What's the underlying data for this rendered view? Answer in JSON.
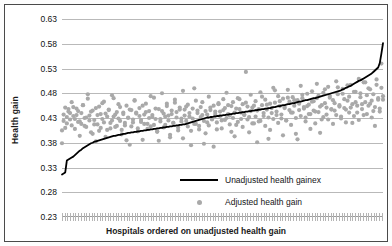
{
  "chart_data": {
    "type": "scatter",
    "title": "",
    "xlabel": "Hospitals ordered on unadjusted health gain",
    "ylabel": "Health gain",
    "ylim": [
      0.23,
      0.63
    ],
    "yticks": [
      "0.23",
      "0.28",
      "0.33",
      "0.38",
      "0.43",
      "0.48",
      "0.53",
      "0.58",
      "0.63"
    ],
    "ytick_values": [
      0.23,
      0.28,
      0.33,
      0.38,
      0.43,
      0.48,
      0.53,
      0.58,
      0.63
    ],
    "xticks": [],
    "grid": true,
    "legend_position": "inside-bottom-center",
    "n_points": 200,
    "series": [
      {
        "name": "Unadjusted health gainex",
        "type": "line",
        "color": "#000000",
        "values": [
          0.316,
          0.318,
          0.32,
          0.344,
          0.346,
          0.348,
          0.35,
          0.352,
          0.355,
          0.358,
          0.361,
          0.364,
          0.366,
          0.369,
          0.371,
          0.373,
          0.375,
          0.377,
          0.379,
          0.38,
          0.382,
          0.383,
          0.384,
          0.385,
          0.386,
          0.387,
          0.388,
          0.389,
          0.39,
          0.391,
          0.392,
          0.393,
          0.394,
          0.394,
          0.395,
          0.396,
          0.396,
          0.397,
          0.398,
          0.398,
          0.399,
          0.4,
          0.4,
          0.401,
          0.401,
          0.402,
          0.402,
          0.403,
          0.403,
          0.404,
          0.404,
          0.405,
          0.405,
          0.406,
          0.406,
          0.407,
          0.407,
          0.408,
          0.408,
          0.409,
          0.409,
          0.41,
          0.41,
          0.411,
          0.411,
          0.412,
          0.412,
          0.413,
          0.413,
          0.414,
          0.414,
          0.415,
          0.415,
          0.416,
          0.416,
          0.417,
          0.417,
          0.418,
          0.419,
          0.42,
          0.421,
          0.422,
          0.423,
          0.424,
          0.425,
          0.426,
          0.427,
          0.428,
          0.429,
          0.43,
          0.431,
          0.431,
          0.432,
          0.432,
          0.433,
          0.433,
          0.434,
          0.434,
          0.435,
          0.435,
          0.436,
          0.436,
          0.437,
          0.437,
          0.438,
          0.438,
          0.439,
          0.439,
          0.44,
          0.44,
          0.441,
          0.441,
          0.442,
          0.442,
          0.443,
          0.443,
          0.444,
          0.444,
          0.445,
          0.445,
          0.446,
          0.446,
          0.447,
          0.447,
          0.448,
          0.448,
          0.449,
          0.449,
          0.45,
          0.45,
          0.451,
          0.452,
          0.452,
          0.453,
          0.454,
          0.454,
          0.455,
          0.456,
          0.456,
          0.457,
          0.458,
          0.458,
          0.459,
          0.46,
          0.46,
          0.461,
          0.462,
          0.463,
          0.463,
          0.464,
          0.465,
          0.466,
          0.466,
          0.467,
          0.468,
          0.469,
          0.47,
          0.47,
          0.471,
          0.472,
          0.473,
          0.474,
          0.475,
          0.476,
          0.477,
          0.478,
          0.479,
          0.48,
          0.481,
          0.482,
          0.483,
          0.484,
          0.485,
          0.486,
          0.488,
          0.489,
          0.491,
          0.492,
          0.494,
          0.495,
          0.497,
          0.499,
          0.501,
          0.503,
          0.505,
          0.506,
          0.508,
          0.51,
          0.512,
          0.514,
          0.516,
          0.518,
          0.52,
          0.523,
          0.526,
          0.529,
          0.532,
          0.541,
          0.56,
          0.581
        ]
      },
      {
        "name": "Adjusted health gain",
        "type": "scatter",
        "color": "#a9a9a9",
        "values": [
          0.379,
          0.424,
          0.41,
          0.432,
          0.448,
          0.44,
          0.415,
          0.452,
          0.428,
          0.436,
          0.444,
          0.423,
          0.418,
          0.456,
          0.43,
          0.412,
          0.478,
          0.435,
          0.443,
          0.398,
          0.426,
          0.45,
          0.417,
          0.404,
          0.438,
          0.46,
          0.421,
          0.392,
          0.433,
          0.446,
          0.409,
          0.425,
          0.47,
          0.437,
          0.414,
          0.429,
          0.452,
          0.406,
          0.441,
          0.42,
          0.385,
          0.431,
          0.447,
          0.413,
          0.427,
          0.465,
          0.439,
          0.403,
          0.434,
          0.422,
          0.455,
          0.418,
          0.442,
          0.408,
          0.43,
          0.474,
          0.436,
          0.416,
          0.449,
          0.402,
          0.384,
          0.428,
          0.444,
          0.411,
          0.433,
          0.459,
          0.425,
          0.396,
          0.438,
          0.42,
          0.467,
          0.431,
          0.405,
          0.447,
          0.423,
          0.389,
          0.435,
          0.453,
          0.413,
          0.44,
          0.375,
          0.429,
          0.49,
          0.418,
          0.445,
          0.407,
          0.432,
          0.462,
          0.424,
          0.399,
          0.437,
          0.415,
          0.451,
          0.428,
          0.372,
          0.443,
          0.421,
          0.458,
          0.434,
          0.409,
          0.446,
          0.426,
          0.481,
          0.438,
          0.417,
          0.454,
          0.43,
          0.393,
          0.449,
          0.422,
          0.468,
          0.441,
          0.412,
          0.436,
          0.461,
          0.427,
          0.401,
          0.444,
          0.419,
          0.455,
          0.433,
          0.381,
          0.448,
          0.424,
          0.473,
          0.44,
          0.414,
          0.457,
          0.431,
          0.406,
          0.45,
          0.428,
          0.486,
          0.443,
          0.42,
          0.464,
          0.437,
          0.395,
          0.452,
          0.425,
          0.471,
          0.446,
          0.416,
          0.441,
          0.466,
          0.43,
          0.387,
          0.459,
          0.434,
          0.477,
          0.449,
          0.423,
          0.454,
          0.438,
          0.408,
          0.463,
          0.445,
          0.419,
          0.47,
          0.442,
          0.4,
          0.456,
          0.432,
          0.488,
          0.451,
          0.427,
          0.475,
          0.447,
          0.418,
          0.46,
          0.436,
          0.492,
          0.453,
          0.429,
          0.479,
          0.45,
          0.421,
          0.465,
          0.441,
          0.497,
          0.458,
          0.434,
          0.483,
          0.455,
          0.426,
          0.472,
          0.448,
          0.502,
          0.462,
          0.438,
          0.49,
          0.459,
          0.431,
          0.478,
          0.452,
          0.508,
          0.467,
          0.443,
          0.54,
          0.474
        ]
      },
      {
        "name": "Adjusted health gain (second cloud)",
        "type": "scatter",
        "color": "#a9a9a9",
        "values": [
          0.405,
          0.437,
          0.451,
          0.419,
          0.443,
          0.427,
          0.462,
          0.434,
          0.408,
          0.449,
          0.422,
          0.394,
          0.44,
          0.456,
          0.414,
          0.431,
          0.469,
          0.425,
          0.401,
          0.445,
          0.417,
          0.383,
          0.436,
          0.453,
          0.41,
          0.428,
          0.463,
          0.439,
          0.406,
          0.447,
          0.42,
          0.476,
          0.433,
          0.412,
          0.442,
          0.458,
          0.424,
          0.397,
          0.438,
          0.415,
          0.455,
          0.43,
          0.376,
          0.446,
          0.421,
          0.466,
          0.441,
          0.409,
          0.45,
          0.426,
          0.386,
          0.437,
          0.459,
          0.418,
          0.444,
          0.413,
          0.432,
          0.471,
          0.428,
          0.403,
          0.448,
          0.423,
          0.48,
          0.439,
          0.416,
          0.454,
          0.435,
          0.391,
          0.445,
          0.42,
          0.461,
          0.442,
          0.411,
          0.451,
          0.429,
          0.485,
          0.447,
          0.424,
          0.457,
          0.433,
          0.404,
          0.449,
          0.418,
          0.465,
          0.44,
          0.414,
          0.452,
          0.436,
          0.378,
          0.444,
          0.421,
          0.473,
          0.446,
          0.427,
          0.455,
          0.438,
          0.407,
          0.46,
          0.443,
          0.425,
          0.468,
          0.45,
          0.43,
          0.456,
          0.435,
          0.402,
          0.462,
          0.441,
          0.416,
          0.47,
          0.448,
          0.428,
          0.458,
          0.437,
          0.523,
          0.453,
          0.432,
          0.477,
          0.451,
          0.419,
          0.464,
          0.445,
          0.423,
          0.482,
          0.456,
          0.434,
          0.467,
          0.447,
          0.388,
          0.459,
          0.44,
          0.491,
          0.461,
          0.436,
          0.474,
          0.454,
          0.429,
          0.469,
          0.45,
          0.425,
          0.487,
          0.463,
          0.441,
          0.472,
          0.455,
          0.398,
          0.466,
          0.446,
          0.495,
          0.47,
          0.452,
          0.431,
          0.479,
          0.457,
          0.438,
          0.484,
          0.464,
          0.443,
          0.499,
          0.475,
          0.453,
          0.427,
          0.481,
          0.46,
          0.437,
          0.493,
          0.471,
          0.448,
          0.466,
          0.445,
          0.504,
          0.478,
          0.456,
          0.433,
          0.489,
          0.468,
          0.447,
          0.496,
          0.473,
          0.451,
          0.42,
          0.483,
          0.462,
          0.441,
          0.509,
          0.48,
          0.458,
          0.436,
          0.502,
          0.476,
          0.455,
          0.488,
          0.465,
          0.444,
          0.414,
          0.497,
          0.47,
          0.449,
          0.491,
          0.467
        ]
      }
    ]
  },
  "legend": {
    "line_label": "Unadjusted health gainex",
    "dot_label": "Adjusted health gain"
  },
  "axes": {
    "y_title": "Health gain",
    "x_title": "Hospitals ordered on unadjusted health gain"
  }
}
